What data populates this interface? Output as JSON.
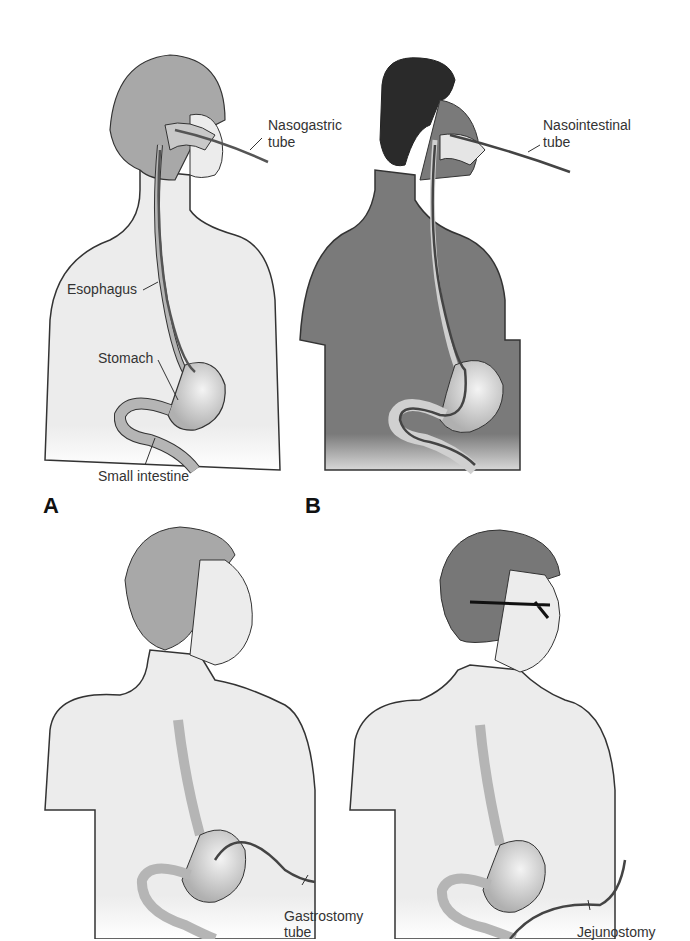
{
  "panels": [
    {
      "letter": "A",
      "tube": "Nasogastric tube",
      "labels": {
        "tube_line1": "Nasogastric",
        "tube_line2": "tube",
        "esophagus": "Esophagus",
        "stomach": "Stomach",
        "small_intestine": "Small intestine"
      }
    },
    {
      "letter": "B",
      "tube": "Nasointestinal tube",
      "labels": {
        "tube_line1": "Nasointestinal",
        "tube_line2": "tube"
      }
    },
    {
      "letter": "",
      "tube": "Gastrostomy tube",
      "labels": {
        "tube_line1": "Gastrostomy",
        "tube_line2": "tube"
      }
    },
    {
      "letter": "",
      "tube": "Jejunostomy tube",
      "labels": {
        "tube_line1": "Jejunostomy"
      }
    }
  ],
  "colors": {
    "skin_light": "#ececec",
    "skin_dark": "#7a7a7a",
    "hair_light": "#a8a8a8",
    "hair_dark": "#2a2a2a",
    "organ": "#b5b5b5",
    "outline": "#333333"
  }
}
